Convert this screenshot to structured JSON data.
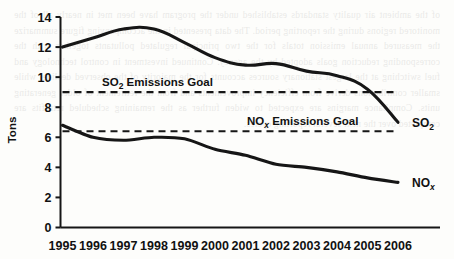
{
  "figure": {
    "background_color": "#fdfdfb",
    "ink_color": "#161616",
    "y_axis_title": "Tons",
    "bleed_through_text": "of the ambient air quality standards established under the program have been met in nearly all of the monitored regions during the reporting period. The data presented in the accompanying figure summarize the measured annual emission totals for the two principal regulated pollutants together with the corresponding reduction goals adopted by the agency. Continued investment in control technology and fuel switching at the largest stationary sources accounts for the majority of the observed decline, while smaller contributions derive from efficiency improvements and from the retirement of older generating units. Compliance margins are expected to widen further as the remaining scheduled retrofits are completed over the next several reporting cycles."
  },
  "chart_data": {
    "type": "line",
    "title": "",
    "xlabel": "",
    "ylabel": "Tons",
    "ylim": [
      0,
      14
    ],
    "y_ticks": [
      0,
      2,
      4,
      6,
      8,
      10,
      12,
      14
    ],
    "y_tick_labels": [
      "0",
      "2",
      "4",
      "6",
      "8",
      "10",
      "12",
      "14"
    ],
    "grid": false,
    "legend_position": "right-inline",
    "categories": [
      "1995",
      "1996",
      "1997",
      "1998",
      "1999",
      "2000",
      "2001",
      "2002",
      "2003",
      "2004",
      "2005",
      "2006"
    ],
    "series": [
      {
        "name": "SO2",
        "label_main": "SO",
        "label_sub": "2",
        "style": "solid",
        "color": "#161616",
        "values": [
          12.0,
          12.6,
          13.2,
          13.2,
          12.3,
          11.3,
          10.8,
          10.9,
          10.4,
          10.1,
          9.2,
          7.0
        ]
      },
      {
        "name": "NOx",
        "label_main": "NO",
        "label_sub": "x",
        "style": "solid",
        "color": "#161616",
        "values": [
          6.8,
          6.0,
          5.8,
          6.0,
          5.9,
          5.2,
          4.8,
          4.2,
          4.0,
          3.7,
          3.3,
          3.0
        ]
      }
    ],
    "reference_lines": [
      {
        "name": "so2-goal",
        "value": 9.0,
        "style": "dashed",
        "color": "#161616",
        "label_prefix": "SO",
        "label_sub": "2",
        "label_suffix": " Emissions Goal"
      },
      {
        "name": "nox-goal",
        "value": 6.4,
        "style": "dashed",
        "color": "#161616",
        "label_prefix": "NO",
        "label_sub": "x",
        "label_suffix": " Emissions Goal"
      }
    ]
  }
}
